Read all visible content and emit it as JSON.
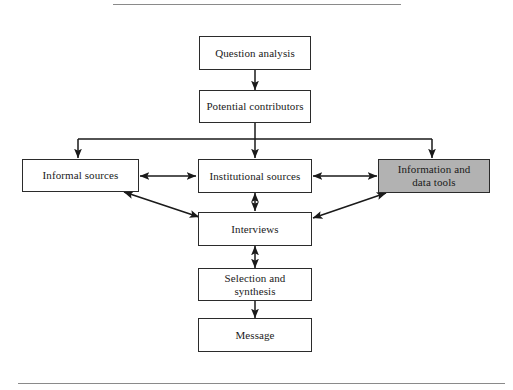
{
  "figure": {
    "type": "flowchart",
    "background_color": "#ffffff",
    "node_border_color": "#2b2b2b",
    "node_fill_color": "#ffffff",
    "highlight_fill_color": "#b2b2b2",
    "edge_color": "#1a1a1a",
    "rule_color": "#8a8a8a"
  },
  "rules": {
    "top": "",
    "bottom": ""
  },
  "nodes": [
    {
      "id": "question-analysis",
      "label": "Question analysis",
      "shaded": false
    },
    {
      "id": "potential-contributors",
      "label": "Potential contributors",
      "shaded": false
    },
    {
      "id": "informal-sources",
      "label": "Informal sources",
      "shaded": false
    },
    {
      "id": "institutional-sources",
      "label": "Institutional sources",
      "shaded": false
    },
    {
      "id": "information-data-tools",
      "label": "Information and\ndata tools",
      "shaded": true
    },
    {
      "id": "interviews",
      "label": "Interviews",
      "shaded": false
    },
    {
      "id": "selection-synthesis",
      "label": "Selection and synthesis",
      "shaded": false
    },
    {
      "id": "message",
      "label": "Message",
      "shaded": false
    }
  ],
  "edges": [
    {
      "from": "question-analysis",
      "to": "potential-contributors",
      "direction": "one-way"
    },
    {
      "from": "potential-contributors",
      "to": "informal-sources",
      "direction": "one-way"
    },
    {
      "from": "potential-contributors",
      "to": "institutional-sources",
      "direction": "one-way"
    },
    {
      "from": "potential-contributors",
      "to": "information-data-tools",
      "direction": "one-way"
    },
    {
      "from": "informal-sources",
      "to": "institutional-sources",
      "direction": "two-way"
    },
    {
      "from": "institutional-sources",
      "to": "information-data-tools",
      "direction": "two-way"
    },
    {
      "from": "informal-sources",
      "to": "interviews",
      "direction": "two-way"
    },
    {
      "from": "institutional-sources",
      "to": "interviews",
      "direction": "two-way"
    },
    {
      "from": "information-data-tools",
      "to": "interviews",
      "direction": "two-way"
    },
    {
      "from": "interviews",
      "to": "selection-synthesis",
      "direction": "two-way"
    },
    {
      "from": "selection-synthesis",
      "to": "message",
      "direction": "one-way"
    }
  ]
}
